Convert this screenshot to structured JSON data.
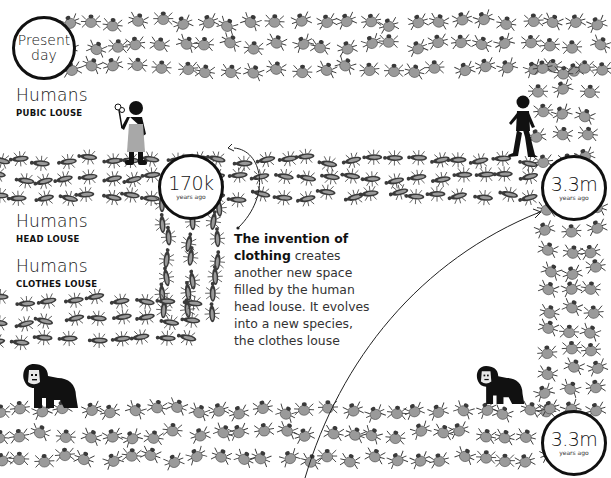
{
  "timeline_markers": {
    "present": {
      "line1": "Present",
      "line2": "day"
    },
    "head_split": {
      "value": "170k",
      "unit": "years ago"
    },
    "pubic_origin": {
      "value": "3.3m",
      "unit": "years ago"
    },
    "gorilla_split": {
      "value": "3.3m",
      "unit": "years ago"
    }
  },
  "lineages": [
    {
      "host": "Humans",
      "louse": "PUBIC LOUSE"
    },
    {
      "host": "Humans",
      "louse": "HEAD LOUSE"
    },
    {
      "host": "Humans",
      "louse": "CLOTHES LOUSE"
    }
  ],
  "annotation": {
    "bold": "The invention of clothing",
    "rest": " creates another new space filled by the human head louse. It evolves into a new species, the clothes louse"
  },
  "icons": [
    "pubic-louse-icon",
    "head-louse-icon",
    "clothes-louse-icon",
    "gorilla-louse-icon",
    "human-figure-icon",
    "gorilla-icon",
    "arrow-curve-icon"
  ],
  "colors": {
    "ink": "#111111",
    "louse_fill": "#9a9a9a",
    "louse_dark": "#3a3a3a",
    "dress": "#a8a8a8"
  },
  "bands": {
    "pubic_top": {
      "x0": 70,
      "x1": 600,
      "y0": 22,
      "y1": 80,
      "step": 23,
      "rows": 3
    },
    "pubic_right": {
      "x0": 540,
      "x1": 600,
      "y0": 70,
      "y1": 160,
      "step": 22,
      "cols": 3
    },
    "head_band": {
      "x0": 0,
      "x1": 545,
      "y0": 160,
      "y1": 205,
      "step": 22,
      "rows": 3
    },
    "clothes_vert": {
      "x0": 165,
      "x1": 228,
      "y0": 205,
      "y1": 315,
      "step": 18,
      "cols": 3
    },
    "clothes_horiz": {
      "x0": 0,
      "x1": 200,
      "y0": 300,
      "y1": 350,
      "step": 24,
      "rows": 3
    },
    "gorilla_right": {
      "x0": 548,
      "x1": 605,
      "y0": 210,
      "y1": 410,
      "step": 20,
      "cols": 3
    },
    "gorilla_bottom": {
      "x0": 0,
      "x1": 560,
      "y0": 410,
      "y1": 470,
      "step": 22,
      "rows": 3
    }
  }
}
